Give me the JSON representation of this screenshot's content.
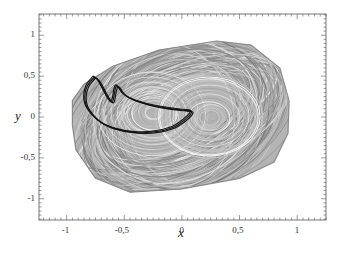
{
  "chart_data": {
    "type": "line",
    "title": "",
    "xlabel": "x",
    "ylabel": "y",
    "xlim": [
      -1.24,
      1.25
    ],
    "ylim": [
      -1.26,
      1.26
    ],
    "grid": false,
    "legend": null,
    "x_ticks": [
      "-1",
      "-0,5",
      "0",
      "0,5",
      "1"
    ],
    "x_tick_values": [
      -1,
      -0.5,
      0,
      0.5,
      1
    ],
    "y_ticks": [
      "1",
      "0,5",
      "0",
      "-0,5",
      "-1"
    ],
    "y_tick_values": [
      1,
      0.5,
      0,
      -0.5,
      -1
    ],
    "minor_ticks_per_major": 10,
    "series": [
      {
        "name": "chaotic attractor (gray)",
        "color": "#9a9a9a",
        "description": "Dense rounded-parallelogram band of overlapping orbits, with figure-eight-like inner loops centered near (-0.25,0.05) and (0.25,0)",
        "outer_boundary": [
          [
            -0.95,
            0.2
          ],
          [
            -0.85,
            0.4
          ],
          [
            -0.6,
            0.62
          ],
          [
            -0.2,
            0.82
          ],
          [
            0.3,
            0.93
          ],
          [
            0.6,
            0.88
          ],
          [
            0.85,
            0.6
          ],
          [
            0.93,
            0.2
          ],
          [
            0.92,
            -0.2
          ],
          [
            0.8,
            -0.55
          ],
          [
            0.5,
            -0.75
          ],
          [
            0,
            -0.88
          ],
          [
            -0.45,
            -0.92
          ],
          [
            -0.75,
            -0.75
          ],
          [
            -0.92,
            -0.4
          ],
          [
            -0.95,
            -0.1
          ]
        ]
      },
      {
        "name": "periodic orbit (black)",
        "color": "#111111",
        "description": "Closed crescent / fin-shaped loop in the upper-left region, traced with multiple close strands",
        "points": [
          [
            -0.76,
            0.49
          ],
          [
            -0.83,
            0.38
          ],
          [
            -0.85,
            0.2
          ],
          [
            -0.8,
            0.05
          ],
          [
            -0.68,
            -0.1
          ],
          [
            -0.5,
            -0.18
          ],
          [
            -0.3,
            -0.2
          ],
          [
            -0.1,
            -0.15
          ],
          [
            0.02,
            -0.05
          ],
          [
            0.1,
            0.07
          ],
          [
            0.05,
            0.08
          ],
          [
            -0.1,
            0.1
          ],
          [
            -0.3,
            0.15
          ],
          [
            -0.5,
            0.25
          ],
          [
            -0.56,
            0.4
          ],
          [
            -0.58,
            0.35
          ],
          [
            -0.6,
            0.15
          ],
          [
            -0.65,
            0.25
          ],
          [
            -0.72,
            0.45
          ],
          [
            -0.76,
            0.49
          ]
        ]
      }
    ]
  },
  "axes": {
    "x_label": "x",
    "y_label": "y"
  }
}
